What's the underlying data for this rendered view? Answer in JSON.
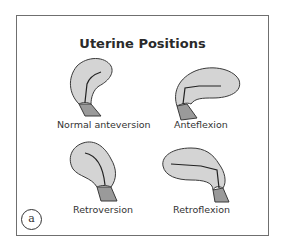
{
  "figure": {
    "title": "Uterine Positions",
    "panel_label": "a",
    "items": [
      {
        "label": "Normal anteversion"
      },
      {
        "label": "Anteflexion"
      },
      {
        "label": "Retroversion"
      },
      {
        "label": "Retroflexion"
      }
    ]
  },
  "colors": {
    "uterus_fill": "#d4d4d4",
    "cervix_fill": "#9a9a9a",
    "outline": "#3a3a3a",
    "frame": "#6f6f6f"
  }
}
